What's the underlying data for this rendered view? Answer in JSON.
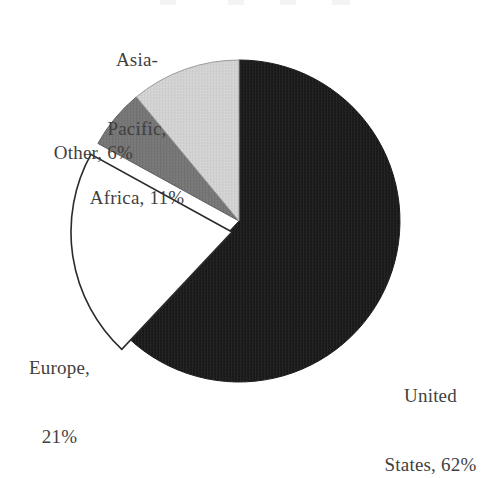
{
  "chart_data": {
    "type": "pie",
    "title": "",
    "categories": [
      "United States",
      "Europe",
      "Other",
      "Asia-Pacific, Africa"
    ],
    "values": [
      62,
      21,
      6,
      11
    ],
    "unit": "%",
    "legend_position": "outside-labels",
    "grid": false,
    "slices": [
      {
        "name": "United States",
        "value": 62,
        "label_lines": [
          "United",
          "States, 62%"
        ],
        "color": "#1c1c1c",
        "exploded": false,
        "start_angle_deg": 0,
        "end_angle_deg": 223.2
      },
      {
        "name": "Europe",
        "value": 21,
        "label_lines": [
          "Europe,",
          "21%"
        ],
        "color": "#ffffff",
        "exploded": true,
        "start_angle_deg": 223.2,
        "end_angle_deg": 298.8
      },
      {
        "name": "Other",
        "value": 6,
        "label_lines": [
          "Other, 6%"
        ],
        "color": "#777777",
        "exploded": false,
        "start_angle_deg": 298.8,
        "end_angle_deg": 320.4
      },
      {
        "name": "Asia-Pacific, Africa",
        "value": 11,
        "label_lines": [
          "Asia-",
          "Pacific,",
          "Africa, 11%"
        ],
        "color": "#d2d2d2",
        "exploded": false,
        "start_angle_deg": 320.4,
        "end_angle_deg": 360
      }
    ],
    "xlabel": "",
    "ylabel": ""
  },
  "labels": {
    "asia": {
      "line1": "Asia-",
      "line2": "Pacific,",
      "line3": "Africa, 11%"
    },
    "other": {
      "line1": "Other, 6%"
    },
    "europe": {
      "line1": "Europe,",
      "line2": "21%"
    },
    "united_states": {
      "line1": "United",
      "line2": "States, 62%"
    }
  },
  "colors": {
    "background": "#ffffff",
    "text": "#3f3f3f",
    "outline": "#2b2b2b",
    "united_states": "#1c1c1c",
    "europe": "#ffffff",
    "other": "#777777",
    "asia_pacific_africa": "#d2d2d2"
  },
  "geometry": {
    "center_x": 239,
    "center_y": 221,
    "radius": 161
  }
}
